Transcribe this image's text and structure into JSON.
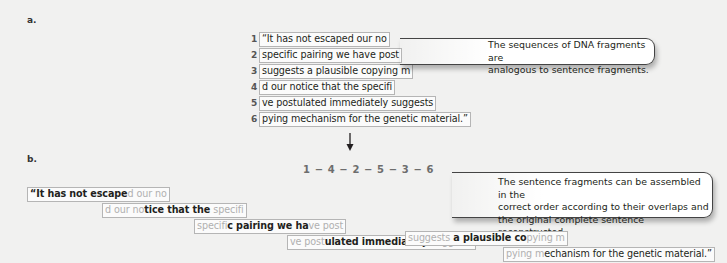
{
  "panel_a": {
    "label": "a.",
    "fragments": [
      {
        "num": "1",
        "text": "“It has not escaped our no"
      },
      {
        "num": "2",
        "text": "specific pairing we have post"
      },
      {
        "num": "3",
        "text": "suggests a plausible copying m"
      },
      {
        "num": "4",
        "text": "d our notice that the specifi"
      },
      {
        "num": "5",
        "text": "ve postulated immediately suggests"
      },
      {
        "num": "6",
        "text": "pying mechanism for the genetic material.”"
      }
    ],
    "callout": {
      "line1": "The sequences of DNA fragments are",
      "line2": "analogous to sentence fragments."
    }
  },
  "arrow": {
    "icon": "down-arrow-icon"
  },
  "panel_b": {
    "label": "b.",
    "order": "1 − 4 − 2 − 5 − 3 − 6",
    "callout": {
      "line1": "The sentence fragments can be assembled in the",
      "line2": "correct order according to their overlaps and",
      "line3": "the original complete sentence reconstructed."
    },
    "assembled": [
      {
        "overlap_in": "",
        "new": "“It has not escape",
        "overlap_out": "d our no"
      },
      {
        "overlap_in": "d our no",
        "new": "tice that the ",
        "overlap_out": "specifi"
      },
      {
        "overlap_in": "specifi",
        "new": "c pairing we ha",
        "overlap_out": "ve post"
      },
      {
        "overlap_in": "ve post",
        "new": "ulated immediately ",
        "overlap_out": "suggests"
      },
      {
        "overlap_in": "suggests",
        "new": " a plausible co",
        "overlap_out": "pying m"
      },
      {
        "overlap_in": "pying m",
        "new": "echanism for the genetic material.”",
        "overlap_out": ""
      }
    ]
  },
  "colors": {
    "background": "#f1f1f0",
    "text": "#231f20",
    "overlap_text": "#b0b0b0",
    "box_border": "#b5b5b5",
    "callout_border": "#444444"
  }
}
